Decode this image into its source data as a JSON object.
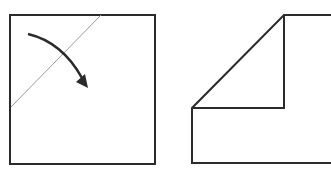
{
  "diagram": {
    "colors": {
      "stroke": "#2b2b2b",
      "crease": "#9a9a9a",
      "background": "#ffffff"
    },
    "panels": [
      {
        "name": "before-fold",
        "description": "Square with diagonal crease line near top-left corner and curved arrow indicating fold direction"
      },
      {
        "name": "after-fold",
        "description": "Square with top-left corner folded down forming a triangle flap"
      }
    ]
  }
}
